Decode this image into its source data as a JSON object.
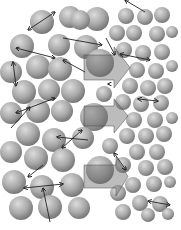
{
  "figure": {
    "width": 181,
    "height": 230,
    "background": "#ffffff",
    "sphere_colors": {
      "light": "#d8d8d8",
      "mid": "#a6a6a6",
      "dark": "#6e6e6e"
    },
    "arrow_color": "#222222",
    "block_arrow_fill": "#6a6a6a",
    "block_arrow_opacity": 0.45
  },
  "spheres_large": [
    {
      "cx": 42,
      "cy": 22,
      "r": 12
    },
    {
      "cx": 70,
      "cy": 17,
      "r": 11
    },
    {
      "cx": 97,
      "cy": 19,
      "r": 12
    },
    {
      "cx": 22,
      "cy": 46,
      "r": 12
    },
    {
      "cx": 59,
      "cy": 45,
      "r": 11
    },
    {
      "cx": 86,
      "cy": 47,
      "r": 12
    },
    {
      "cx": 38,
      "cy": 67,
      "r": 12
    },
    {
      "cx": 60,
      "cy": 69,
      "r": 12
    },
    {
      "cx": 11,
      "cy": 72,
      "r": 11
    },
    {
      "cx": 24,
      "cy": 92,
      "r": 12
    },
    {
      "cx": 49,
      "cy": 90,
      "r": 11
    },
    {
      "cx": 73,
      "cy": 91,
      "r": 12
    },
    {
      "cx": 11,
      "cy": 113,
      "r": 11
    },
    {
      "cx": 38,
      "cy": 111,
      "r": 12
    },
    {
      "cx": 62,
      "cy": 111,
      "r": 11
    },
    {
      "cx": 100,
      "cy": 63,
      "r": 14
    },
    {
      "cx": 94,
      "cy": 117,
      "r": 14
    },
    {
      "cx": 28,
      "cy": 134,
      "r": 12
    },
    {
      "cx": 54,
      "cy": 140,
      "r": 12
    },
    {
      "cx": 83,
      "cy": 138,
      "r": 11
    },
    {
      "cx": 11,
      "cy": 152,
      "r": 11
    },
    {
      "cx": 36,
      "cy": 158,
      "r": 12
    },
    {
      "cx": 63,
      "cy": 160,
      "r": 12
    },
    {
      "cx": 100,
      "cy": 170,
      "r": 14
    },
    {
      "cx": 14,
      "cy": 182,
      "r": 12
    },
    {
      "cx": 42,
      "cy": 187,
      "r": 12
    },
    {
      "cx": 72,
      "cy": 185,
      "r": 12
    },
    {
      "cx": 21,
      "cy": 208,
      "r": 12
    },
    {
      "cx": 50,
      "cy": 207,
      "r": 12
    },
    {
      "cx": 79,
      "cy": 208,
      "r": 11
    },
    {
      "cx": 80,
      "cy": 20,
      "r": 10
    }
  ],
  "spheres_small": [
    {
      "cx": 126,
      "cy": 16,
      "r": 8
    },
    {
      "cx": 145,
      "cy": 17,
      "r": 8
    },
    {
      "cx": 162,
      "cy": 15,
      "r": 8
    },
    {
      "cx": 117,
      "cy": 33,
      "r": 8
    },
    {
      "cx": 134,
      "cy": 33,
      "r": 8
    },
    {
      "cx": 157,
      "cy": 34,
      "r": 8
    },
    {
      "cx": 172,
      "cy": 32,
      "r": 6
    },
    {
      "cx": 124,
      "cy": 50,
      "r": 8
    },
    {
      "cx": 143,
      "cy": 53,
      "r": 8
    },
    {
      "cx": 162,
      "cy": 52,
      "r": 8
    },
    {
      "cx": 137,
      "cy": 70,
      "r": 8
    },
    {
      "cx": 156,
      "cy": 71,
      "r": 8
    },
    {
      "cx": 172,
      "cy": 66,
      "r": 6
    },
    {
      "cx": 130,
      "cy": 86,
      "r": 8
    },
    {
      "cx": 148,
      "cy": 88,
      "r": 8
    },
    {
      "cx": 165,
      "cy": 86,
      "r": 8
    },
    {
      "cx": 123,
      "cy": 102,
      "r": 8
    },
    {
      "cx": 141,
      "cy": 104,
      "r": 8
    },
    {
      "cx": 161,
      "cy": 103,
      "r": 8
    },
    {
      "cx": 134,
      "cy": 120,
      "r": 8
    },
    {
      "cx": 155,
      "cy": 120,
      "r": 8
    },
    {
      "cx": 172,
      "cy": 118,
      "r": 6
    },
    {
      "cx": 127,
      "cy": 136,
      "r": 8
    },
    {
      "cx": 146,
      "cy": 136,
      "r": 8
    },
    {
      "cx": 164,
      "cy": 134,
      "r": 8
    },
    {
      "cx": 110,
      "cy": 146,
      "r": 8
    },
    {
      "cx": 137,
      "cy": 152,
      "r": 8
    },
    {
      "cx": 157,
      "cy": 152,
      "r": 8
    },
    {
      "cx": 123,
      "cy": 165,
      "r": 8
    },
    {
      "cx": 146,
      "cy": 168,
      "r": 8
    },
    {
      "cx": 165,
      "cy": 167,
      "r": 8
    },
    {
      "cx": 133,
      "cy": 185,
      "r": 8
    },
    {
      "cx": 154,
      "cy": 184,
      "r": 8
    },
    {
      "cx": 170,
      "cy": 182,
      "r": 6
    },
    {
      "cx": 118,
      "cy": 193,
      "r": 8
    },
    {
      "cx": 140,
      "cy": 203,
      "r": 8
    },
    {
      "cx": 160,
      "cy": 204,
      "r": 8
    },
    {
      "cx": 123,
      "cy": 212,
      "r": 8
    },
    {
      "cx": 148,
      "cy": 215,
      "r": 7
    },
    {
      "cx": 168,
      "cy": 214,
      "r": 6
    },
    {
      "cx": 104,
      "cy": 94,
      "r": 8
    }
  ],
  "block_arrows": [
    {
      "x0": 84,
      "y0": 55,
      "x1": 114,
      "y1": 80,
      "tip": 130,
      "head_top": 47,
      "head_bottom": 88
    },
    {
      "x0": 84,
      "y0": 106,
      "x1": 114,
      "y1": 126,
      "tip": 128,
      "head_top": 99,
      "head_bottom": 133
    },
    {
      "x0": 84,
      "y0": 165,
      "x1": 116,
      "y1": 188,
      "tip": 128,
      "head_top": 157,
      "head_bottom": 196
    }
  ],
  "line_arrows": [
    {
      "x1": 28,
      "y1": 30,
      "x2": 55,
      "y2": 12,
      "double": true
    },
    {
      "x1": 16,
      "y1": 48,
      "x2": 55,
      "y2": 58,
      "double": true
    },
    {
      "x1": 13,
      "y1": 62,
      "x2": 16,
      "y2": 86,
      "double": true
    },
    {
      "x1": 63,
      "y1": 38,
      "x2": 102,
      "y2": 45,
      "double": false
    },
    {
      "x1": 106,
      "y1": 38,
      "x2": 115,
      "y2": 55,
      "double": false
    },
    {
      "x1": 145,
      "y1": 12,
      "x2": 125,
      "y2": 0,
      "double": false
    },
    {
      "x1": 120,
      "y1": 54,
      "x2": 150,
      "y2": 60,
      "double": true
    },
    {
      "x1": 85,
      "y1": 72,
      "x2": 63,
      "y2": 60,
      "double": false
    },
    {
      "x1": 16,
      "y1": 113,
      "x2": 55,
      "y2": 98,
      "double": true
    },
    {
      "x1": 11,
      "y1": 128,
      "x2": 30,
      "y2": 107,
      "double": false
    },
    {
      "x1": 88,
      "y1": 140,
      "x2": 57,
      "y2": 137,
      "double": false
    },
    {
      "x1": 62,
      "y1": 148,
      "x2": 82,
      "y2": 130,
      "double": true
    },
    {
      "x1": 24,
      "y1": 188,
      "x2": 63,
      "y2": 184,
      "double": true
    },
    {
      "x1": 50,
      "y1": 222,
      "x2": 43,
      "y2": 188,
      "double": false
    },
    {
      "x1": 43,
      "y1": 165,
      "x2": 28,
      "y2": 177,
      "double": false
    },
    {
      "x1": 114,
      "y1": 153,
      "x2": 126,
      "y2": 170,
      "double": true
    },
    {
      "x1": 138,
      "y1": 99,
      "x2": 158,
      "y2": 101,
      "double": true
    },
    {
      "x1": 148,
      "y1": 201,
      "x2": 170,
      "y2": 205,
      "double": true
    },
    {
      "x1": 110,
      "y1": 84,
      "x2": 108,
      "y2": 84,
      "double": false
    }
  ]
}
